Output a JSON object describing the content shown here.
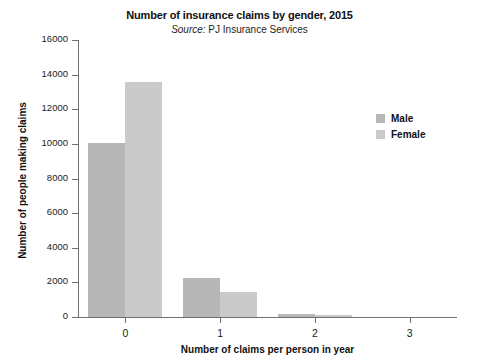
{
  "chart_data": {
    "type": "bar",
    "title": "Number of insurance claims by gender, 2015",
    "subtitle": "Source: PJ Insurance Services",
    "subtitle_source_word": "Source:",
    "subtitle_source_rest": " PJ Insurance Services",
    "xlabel": "Number of claims per person in year",
    "ylabel": "Number of people making claims",
    "categories": [
      "0",
      "1",
      "2",
      "3"
    ],
    "series": [
      {
        "name": "Male",
        "values": [
          10050,
          2230,
          150,
          0
        ],
        "color": "#b7b7b7"
      },
      {
        "name": "Female",
        "values": [
          13550,
          1450,
          90,
          0
        ],
        "color": "#cacaca"
      }
    ],
    "ylim": [
      0,
      16000
    ],
    "ytick_values": [
      0,
      2000,
      4000,
      6000,
      8000,
      10000,
      12000,
      14000,
      16000
    ],
    "ytick_labels": [
      "0",
      "2000",
      "4000",
      "6000",
      "8000",
      "10000",
      "12000",
      "14000",
      "16000"
    ],
    "grid": false,
    "legend_position": "right",
    "legend_entries": [
      "Male",
      "Female"
    ]
  }
}
